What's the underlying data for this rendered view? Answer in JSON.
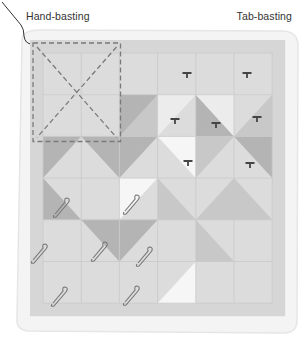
{
  "labels": {
    "hand_basting": "Hand-basting",
    "tab_basting": "Tab-basting"
  },
  "colors": {
    "backing": "#f1f1f1",
    "quilt_bg": "#dcdcdc",
    "border": "#d6d6d6",
    "grid_line": "#c9c9c9",
    "light": "#ececec",
    "mid": "#c8c8c8",
    "dark": "#b4b4b4",
    "white": "#f6f6f6",
    "basting_line": "#7a7a7a",
    "pin": "#777777",
    "tab": "#444444"
  },
  "quilt": {
    "grid": {
      "cols": 6,
      "rows": 6,
      "x0": 43,
      "y0": 53,
      "cell_w": 38.2,
      "cell_h": 41.7
    },
    "triangles": [
      {
        "c": 2,
        "r": 1,
        "shape": "br",
        "tone": "mid"
      },
      {
        "c": 2,
        "r": 1,
        "shape": "tl",
        "tone": "dark"
      },
      {
        "c": 3,
        "r": 1,
        "shape": "tl",
        "tone": "light"
      },
      {
        "c": 4,
        "r": 1,
        "shape": "bl",
        "tone": "dark"
      },
      {
        "c": 4,
        "r": 1,
        "shape": "tr",
        "tone": "light"
      },
      {
        "c": 5,
        "r": 1,
        "shape": "br",
        "tone": "mid"
      },
      {
        "c": 0,
        "r": 2,
        "shape": "tl",
        "tone": "dark"
      },
      {
        "c": 1,
        "r": 2,
        "shape": "tr",
        "tone": "dark"
      },
      {
        "c": 2,
        "r": 2,
        "shape": "tl",
        "tone": "dark"
      },
      {
        "c": 3,
        "r": 2,
        "shape": "tr",
        "tone": "white"
      },
      {
        "c": 4,
        "r": 2,
        "shape": "tl",
        "tone": "mid"
      },
      {
        "c": 5,
        "r": 2,
        "shape": "tr",
        "tone": "dark"
      },
      {
        "c": 0,
        "r": 3,
        "shape": "bl",
        "tone": "dark"
      },
      {
        "c": 2,
        "r": 3,
        "shape": "tl",
        "tone": "white"
      },
      {
        "c": 3,
        "r": 3,
        "shape": "bl",
        "tone": "mid"
      },
      {
        "c": 4,
        "r": 3,
        "shape": "br",
        "tone": "mid"
      },
      {
        "c": 5,
        "r": 3,
        "shape": "bl",
        "tone": "mid"
      },
      {
        "c": 1,
        "r": 4,
        "shape": "tr",
        "tone": "dark"
      },
      {
        "c": 2,
        "r": 4,
        "shape": "tl",
        "tone": "dark"
      },
      {
        "c": 4,
        "r": 4,
        "shape": "bl",
        "tone": "mid"
      },
      {
        "c": 3,
        "r": 5,
        "shape": "br",
        "tone": "white"
      }
    ],
    "hand_basting_area": {
      "x": 33,
      "y": 43,
      "w": 87.5,
      "h": 98.5
    },
    "tabs": [
      {
        "x": 187,
        "y": 73
      },
      {
        "x": 247,
        "y": 73
      },
      {
        "x": 175,
        "y": 119
      },
      {
        "x": 216,
        "y": 123
      },
      {
        "x": 257,
        "y": 117
      },
      {
        "x": 188,
        "y": 161
      },
      {
        "x": 250,
        "y": 163
      }
    ],
    "pins": [
      {
        "x": 63,
        "y": 206
      },
      {
        "x": 133,
        "y": 203
      },
      {
        "x": 41,
        "y": 252
      },
      {
        "x": 101,
        "y": 250
      },
      {
        "x": 146,
        "y": 255
      },
      {
        "x": 61,
        "y": 295
      },
      {
        "x": 133,
        "y": 294
      }
    ]
  }
}
